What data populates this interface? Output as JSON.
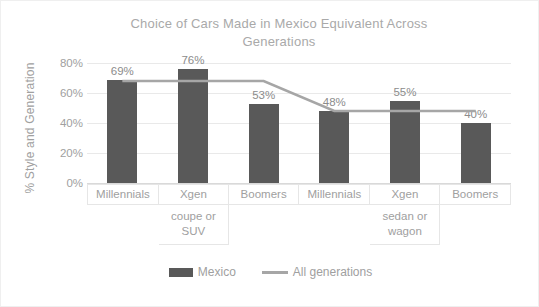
{
  "chart_data": {
    "type": "bar",
    "title": "Choice of Cars Made in Mexico Equivalent Across Generations",
    "title_line1": "Choice of Cars Made in Mexico Equivalent Across",
    "title_line2": "Generations",
    "xlabel": "",
    "ylabel": "% Style and Generation",
    "ylim": [
      0,
      80
    ],
    "grid": true,
    "legend_position": "bottom",
    "categories": [
      "Millennials",
      "Xgen",
      "Boomers",
      "Millennials",
      "Xgen",
      "Boomers"
    ],
    "group_labels": [
      "coupe or SUV",
      "sedan or wagon"
    ],
    "group_label_index": [
      1,
      4
    ],
    "ytick_labels": [
      "80%",
      "60%",
      "40%",
      "20%",
      "0%"
    ],
    "ytick_values": [
      80,
      60,
      40,
      20,
      0
    ],
    "series": [
      {
        "name": "Mexico",
        "type": "bar",
        "color": "#595959",
        "values": [
          69,
          76,
          53,
          48,
          55,
          40
        ],
        "data_labels": [
          "69%",
          "76%",
          "53%",
          "48%",
          "55%",
          "40%"
        ]
      },
      {
        "name": "All generations",
        "type": "line",
        "color": "#a6a6a6",
        "values": [
          68,
          68,
          68,
          48,
          48,
          48
        ]
      }
    ]
  },
  "legend": {
    "items": [
      {
        "label": "Mexico",
        "marker": "bar-swatch",
        "color": "#595959"
      },
      {
        "label": "All generations",
        "marker": "line-swatch",
        "color": "#a6a6a6"
      }
    ]
  },
  "colors": {
    "bar": "#595959",
    "line": "#a6a6a6",
    "text": "#a0a0a0",
    "title": "#a9a9a9",
    "grid": "#e9e9e9",
    "border": "#e6e6e6",
    "background": "#ffffff"
  }
}
